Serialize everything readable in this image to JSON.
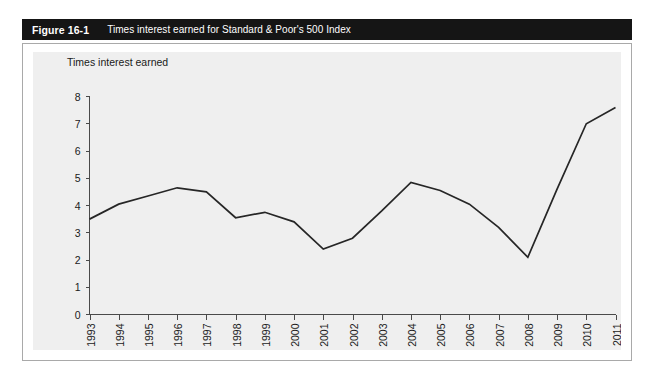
{
  "header": {
    "figure_number": "Figure 16-1",
    "caption": "Times interest earned for Standard & Poor's 500 Index",
    "bar_color": "#151515",
    "text_color": "#ffffff"
  },
  "panel": {
    "background": "#ffffff",
    "border_color": "#a9a9a9",
    "plot_background": "#efefef"
  },
  "chart_data": {
    "type": "line",
    "title": "Times interest earned for Standard & Poor's 500 Index",
    "subtitle": "",
    "xlabel": "",
    "ylabel": "Times interest earned",
    "ylim": [
      0,
      8
    ],
    "ytick_labels": [
      "8",
      "7",
      "6",
      "5",
      "4",
      "3",
      "2",
      "1",
      "0"
    ],
    "yticks": [
      8,
      7,
      6,
      5,
      4,
      3,
      2,
      1,
      0
    ],
    "grid": false,
    "legend_position": "none",
    "line_color": "#262626",
    "categories": [
      "1993",
      "1994",
      "1995",
      "1996",
      "1997",
      "1998",
      "1999",
      "2000",
      "2001",
      "2002",
      "2003",
      "2004",
      "2005",
      "2006",
      "2007",
      "2008",
      "2009",
      "2010",
      "2011"
    ],
    "x": [
      1993,
      1994,
      1995,
      1996,
      1997,
      1998,
      1999,
      2000,
      2001,
      2002,
      2003,
      2004,
      2005,
      2006,
      2007,
      2008,
      2009,
      2010,
      2011
    ],
    "values": [
      3.5,
      4.05,
      4.35,
      4.65,
      4.5,
      3.55,
      3.75,
      3.4,
      2.4,
      2.8,
      3.8,
      4.85,
      4.55,
      4.05,
      3.2,
      2.1,
      4.6,
      7.0,
      7.6
    ],
    "series": [
      {
        "name": "Times interest earned",
        "values": [
          3.5,
          4.05,
          4.35,
          4.65,
          4.5,
          3.55,
          3.75,
          3.4,
          2.4,
          2.8,
          3.8,
          4.85,
          4.55,
          4.05,
          3.2,
          2.1,
          4.6,
          7.0,
          7.6
        ]
      }
    ],
    "annotations": []
  }
}
